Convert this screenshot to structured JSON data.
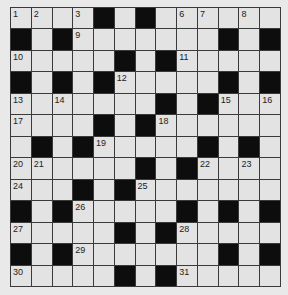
{
  "puzzle": {
    "rows": 13,
    "cols": 13,
    "colors": {
      "cell": "#e3e3e3",
      "block": "#0d0d0d",
      "line": "#3a3a3a",
      "background": "#e9e9e9"
    },
    "grid": [
      "....#.#......",
      "#.#.......#.#",
      ".....#.#.....",
      "#.#.#.....#.#",
      ".......#.#...",
      "....#.#......",
      ".#.#.....#.#.",
      "......#.#....",
      "...#.#.......",
      "#.#.....#.#.#",
      ".....#.#.....",
      "#.#.......#.#",
      ".....#.#....."
    ],
    "numbers": [
      {
        "r": 0,
        "c": 0,
        "n": "1"
      },
      {
        "r": 0,
        "c": 1,
        "n": "2"
      },
      {
        "r": 0,
        "c": 3,
        "n": "3"
      },
      {
        "r": 0,
        "c": 4,
        "n": "4"
      },
      {
        "r": 0,
        "c": 6,
        "n": "5"
      },
      {
        "r": 0,
        "c": 8,
        "n": "6"
      },
      {
        "r": 0,
        "c": 9,
        "n": "7"
      },
      {
        "r": 0,
        "c": 11,
        "n": "8"
      },
      {
        "r": 1,
        "c": 3,
        "n": "9"
      },
      {
        "r": 2,
        "c": 0,
        "n": "10"
      },
      {
        "r": 2,
        "c": 8,
        "n": "11"
      },
      {
        "r": 3,
        "c": 5,
        "n": "12"
      },
      {
        "r": 4,
        "c": 0,
        "n": "13"
      },
      {
        "r": 4,
        "c": 2,
        "n": "14"
      },
      {
        "r": 4,
        "c": 10,
        "n": "15"
      },
      {
        "r": 4,
        "c": 12,
        "n": "16"
      },
      {
        "r": 5,
        "c": 0,
        "n": "17"
      },
      {
        "r": 5,
        "c": 7,
        "n": "18"
      },
      {
        "r": 6,
        "c": 4,
        "n": "19"
      },
      {
        "r": 7,
        "c": 0,
        "n": "20"
      },
      {
        "r": 7,
        "c": 1,
        "n": "21"
      },
      {
        "r": 7,
        "c": 9,
        "n": "22"
      },
      {
        "r": 7,
        "c": 11,
        "n": "23"
      },
      {
        "r": 8,
        "c": 0,
        "n": "24"
      },
      {
        "r": 8,
        "c": 6,
        "n": "25"
      },
      {
        "r": 9,
        "c": 3,
        "n": "26"
      },
      {
        "r": 10,
        "c": 0,
        "n": "27"
      },
      {
        "r": 10,
        "c": 8,
        "n": "28"
      },
      {
        "r": 11,
        "c": 3,
        "n": "29"
      },
      {
        "r": 12,
        "c": 0,
        "n": "30"
      },
      {
        "r": 12,
        "c": 8,
        "n": "31"
      }
    ]
  }
}
